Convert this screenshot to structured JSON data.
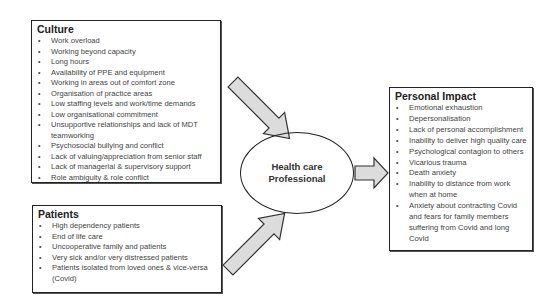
{
  "culture": {
    "title": "Culture",
    "items": [
      "Work overload",
      "Working beyond capacity",
      "Long hours",
      "Availability of PPE and equipment",
      "Working in areas out of comfort zone",
      "Organisation of practice areas",
      "Low staffing levels and work/time demands",
      "Low organisational commitment",
      "Unsupportive relationships and lack of MDT teamworking",
      "Psychosocial bullying and conflict",
      "Lack of valuing/appreciation from senior staff",
      "Lack of managerial & supervisory support",
      "Role ambiguity & role conflict"
    ]
  },
  "patients": {
    "title": "Patients",
    "items": [
      "High dependency patients",
      "End of life care",
      "Uncooperative family and patients",
      "Very sick and/or very distressed patients",
      "Patients isolated from loved ones & vice-versa (Covid)"
    ]
  },
  "center": {
    "label": "Health care Professional"
  },
  "impact": {
    "title": "Personal Impact",
    "items": [
      "Emotional exhaustion",
      "Depersonalisation",
      "Lack of personal accomplishment",
      "Inability to deliver high quality care",
      "Psychological contagion to others",
      "Vicarious trauma",
      "Death anxiety",
      "Inability to distance from work when at home",
      "Anxiety about contracting Covid and fears for family members suffering from Covid and long Covid"
    ]
  },
  "colors": {
    "arrow_fill": "#dcdcdc",
    "border": "#222222"
  }
}
